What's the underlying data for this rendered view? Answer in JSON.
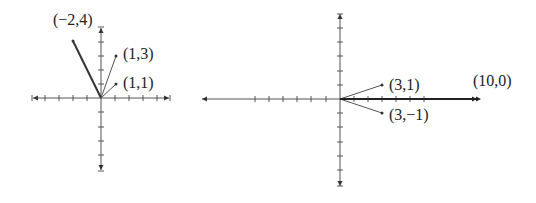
{
  "figure": {
    "left_plot": {
      "origin_px": [
        101,
        98
      ],
      "unit_px": 14,
      "vectors": [
        {
          "to": [
            -2,
            4
          ],
          "label": "(−2,4)",
          "weight": "thick"
        },
        {
          "to": [
            1,
            3
          ],
          "label": "(1,3)",
          "weight": "thin"
        },
        {
          "to": [
            1,
            1
          ],
          "label": "(1,1)",
          "weight": "thin"
        }
      ]
    },
    "right_plot": {
      "origin_px": [
        340,
        99
      ],
      "unit_px": 14,
      "vectors": [
        {
          "to": [
            3,
            1
          ],
          "label": "(3,1)",
          "weight": "thin"
        },
        {
          "to": [
            3,
            -1
          ],
          "label": "(3,−1)",
          "weight": "thin"
        },
        {
          "to": [
            10,
            0
          ],
          "label": "(10,0)",
          "weight": "thick"
        }
      ]
    }
  },
  "colors": {
    "axis": "#555555",
    "vector": "#333333",
    "text": "#222222",
    "background": "#ffffff"
  }
}
